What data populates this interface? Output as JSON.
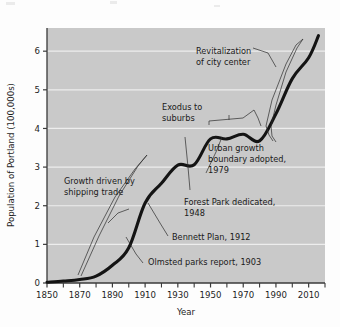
{
  "figure": {
    "name": "population-of-portland-line-chart",
    "background": "#fdfdfd",
    "plot_background": "#c9c9c9",
    "gridline_color": "#ededed",
    "line_color": "#141414",
    "axis_color": "#3a3a3a",
    "text_color": "#1a1a1a"
  },
  "chart_data": {
    "type": "line",
    "title": "",
    "xlabel": "Year",
    "ylabel": "Population of Portland (100,000s)",
    "xlim": [
      1850,
      2020
    ],
    "ylim": [
      0,
      6.6
    ],
    "grid": true,
    "legend": "none",
    "xticks": [
      1850,
      1870,
      1890,
      1910,
      1930,
      1950,
      1970,
      1990,
      2010
    ],
    "xtick_labels": [
      "1850",
      "1870",
      "1890",
      "1910",
      "1930",
      "1950",
      "1970",
      "1990",
      "2010"
    ],
    "xminor_ticks": [
      1860,
      1880,
      1900,
      1920,
      1940,
      1960,
      1980,
      2000,
      2020
    ],
    "yticks": [
      0,
      1,
      2,
      3,
      4,
      5,
      6
    ],
    "ytick_labels": [
      "0",
      "1",
      "2",
      "3",
      "4",
      "5",
      "6"
    ],
    "series": [
      {
        "name": "Population of Portland",
        "x": [
          1850,
          1860,
          1870,
          1880,
          1890,
          1900,
          1910,
          1920,
          1930,
          1940,
          1950,
          1960,
          1970,
          1980,
          1990,
          2000,
          2010,
          2016
        ],
        "y": [
          0.02,
          0.05,
          0.09,
          0.18,
          0.46,
          0.91,
          2.07,
          2.58,
          3.05,
          3.06,
          3.73,
          3.73,
          3.85,
          3.68,
          4.38,
          5.29,
          5.83,
          6.4
        ]
      }
    ],
    "annotations": [
      {
        "id": "revitalization",
        "text_lines": [
          "Revitalization",
          "of city center"
        ],
        "points_to_year": 1998
      },
      {
        "id": "exodus",
        "text_lines": [
          "Exodus to",
          "suburbs"
        ],
        "points_to_year": 1965
      },
      {
        "id": "urban-growth-boundary",
        "text_lines": [
          "Urban growth",
          "boundary adopted,",
          "1979"
        ],
        "points_to_year": 1980
      },
      {
        "id": "growth-shipping",
        "text_lines": [
          "Growth driven by",
          "shipping trade"
        ],
        "points_to_year": 1885
      },
      {
        "id": "forest-park",
        "text_lines": [
          "Forest Park dedicated,",
          "1948"
        ],
        "points_to_year": 1948
      },
      {
        "id": "bennett-plan",
        "text_lines": [
          "Bennett Plan, 1912"
        ],
        "points_to_year": 1912
      },
      {
        "id": "olmsted-report",
        "text_lines": [
          "Olmsted parks report, 1903"
        ],
        "points_to_year": 1903
      }
    ]
  },
  "axes": {
    "y_axis_title": "Population of Portland (100,000s)",
    "x_axis_title": "Year"
  },
  "annotation_text": {
    "revitalization_l1": "Revitalization",
    "revitalization_l2": "of city center",
    "exodus_l1": "Exodus to",
    "exodus_l2": "suburbs",
    "ugb_l1": "Urban growth",
    "ugb_l2": "boundary adopted,",
    "ugb_l3": "1979",
    "shipping_l1": "Growth driven by",
    "shipping_l2": "shipping trade",
    "forestpark_l1": "Forest Park dedicated,",
    "forestpark_l2": "1948",
    "bennett_l1": "Bennett Plan, 1912",
    "olmsted_l1": "Olmsted parks report, 1903"
  }
}
